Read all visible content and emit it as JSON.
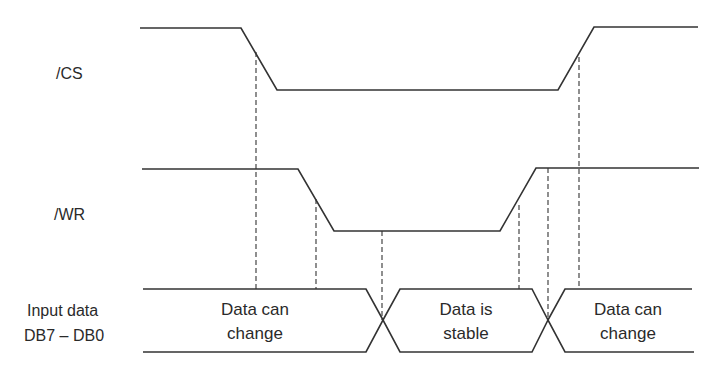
{
  "diagram": {
    "type": "timing-diagram",
    "signals": [
      {
        "name": "/CS",
        "label": "/CS"
      },
      {
        "name": "/WR",
        "label": "/WR"
      },
      {
        "name": "data-bus",
        "label_line1": "Input data",
        "label_line2": "DB7 – DB0"
      }
    ],
    "regions": [
      {
        "line1": "Data can",
        "line2": "change"
      },
      {
        "line1": "Data is",
        "line2": "stable"
      },
      {
        "line1": "Data can",
        "line2": "change"
      }
    ],
    "colors": {
      "line": "#333333",
      "background": "#ffffff",
      "text": "#2a2a2a"
    }
  }
}
